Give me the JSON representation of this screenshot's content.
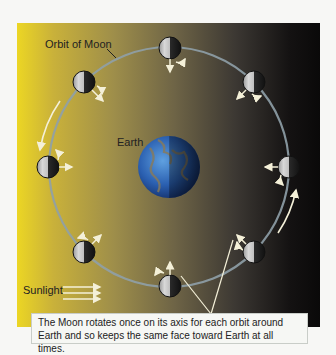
{
  "labels": {
    "orbit": "Orbit of Moon",
    "earth": "Earth",
    "sunlight": "Sunlight"
  },
  "caption": {
    "line1": "The Moon rotates once on its axis for each orbit around",
    "line2": "Earth and so keeps the same face toward Earth at all times."
  },
  "colors": {
    "sun_side": "#ecd624",
    "dark_side": "#0a0909",
    "orbit": "#8fa0a8",
    "earth": "#2f6fc0",
    "moon_lit": "#c8c8c8",
    "moon_dark": "#1a1a1a"
  },
  "moons": [
    {
      "position": "top",
      "x": 170,
      "y": 48
    },
    {
      "position": "upper-right",
      "x": 254,
      "y": 82
    },
    {
      "position": "right",
      "x": 289,
      "y": 167
    },
    {
      "position": "lower-right",
      "x": 254,
      "y": 252
    },
    {
      "position": "bottom",
      "x": 170,
      "y": 286
    },
    {
      "position": "lower-left",
      "x": 84,
      "y": 252
    },
    {
      "position": "left",
      "x": 48,
      "y": 167
    },
    {
      "position": "upper-left",
      "x": 84,
      "y": 82
    }
  ]
}
